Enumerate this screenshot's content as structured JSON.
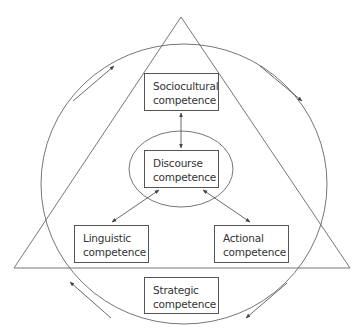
{
  "diagram": {
    "title": "",
    "colors": {
      "stroke": "#555555",
      "text": "#333333",
      "background": "#ffffff"
    },
    "nodes": {
      "sociocultural": {
        "line1": "Sociocultural",
        "line2": "competence"
      },
      "discourse": {
        "line1": "Discourse",
        "line2": "competence"
      },
      "linguistic": {
        "line1": "Linguistic",
        "line2": "competence"
      },
      "actional": {
        "line1": "Actional",
        "line2": "competence"
      },
      "strategic": {
        "line1": "Strategic",
        "line2": "competence"
      }
    },
    "edges": [
      {
        "from": "sociocultural",
        "to": "discourse",
        "type": "bidirectional"
      },
      {
        "from": "discourse",
        "to": "linguistic",
        "type": "bidirectional"
      },
      {
        "from": "discourse",
        "to": "actional",
        "type": "bidirectional"
      }
    ],
    "shapes": [
      "triangle",
      "outer-circle",
      "inner-ellipse"
    ],
    "rotation_arrows": {
      "direction": "clockwise",
      "count": 4
    }
  }
}
